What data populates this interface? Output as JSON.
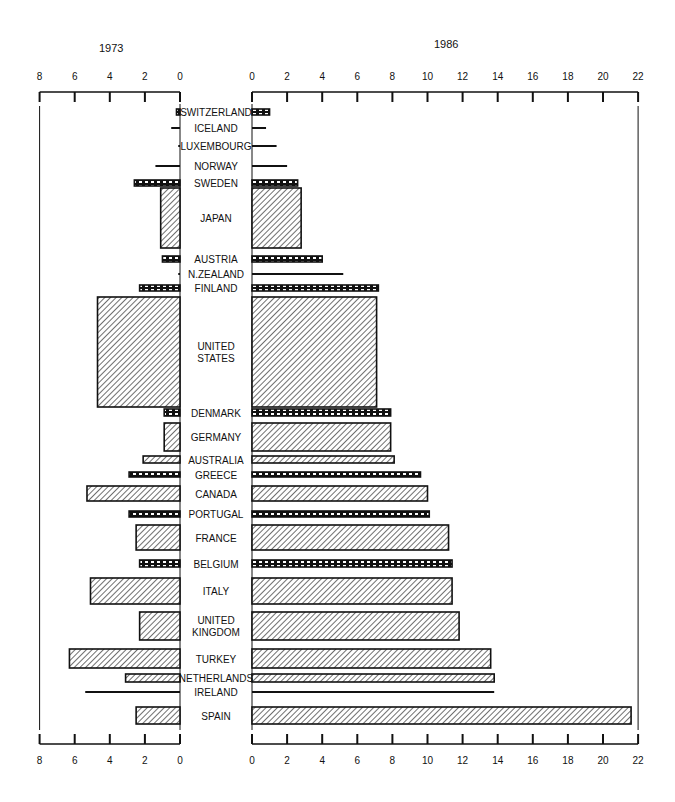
{
  "chart_data": {
    "type": "bar",
    "orientation": "horizontal",
    "layout": "back-to-back (population pyramid style) with central country label column",
    "title": "",
    "series": [
      {
        "name": "1973",
        "side": "left",
        "axis_ticks": [
          8,
          6,
          4,
          2,
          0
        ],
        "values": [
          0.2,
          0.5,
          0.1,
          1.4,
          2.6,
          1.1,
          1.0,
          0.1,
          2.3,
          4.7,
          0.9,
          0.9,
          2.1,
          2.9,
          5.3,
          2.9,
          2.5,
          2.3,
          5.1,
          2.3,
          6.3,
          3.1,
          5.4,
          2.5
        ]
      },
      {
        "name": "1986",
        "side": "right",
        "axis_ticks": [
          0,
          2,
          4,
          6,
          8,
          10,
          12,
          14,
          16,
          18,
          20,
          22
        ],
        "values": [
          1.0,
          0.8,
          1.4,
          2.0,
          2.6,
          2.8,
          4.0,
          5.2,
          7.2,
          7.1,
          7.9,
          7.9,
          8.1,
          9.6,
          10.0,
          10.1,
          11.2,
          11.4,
          11.4,
          11.8,
          13.6,
          13.8,
          13.8,
          21.6
        ]
      }
    ],
    "categories": [
      "SWITZERLAND",
      "ICELAND",
      "LUXEMBOURG",
      "NORWAY",
      "SWEDEN",
      "JAPAN",
      "AUSTRIA",
      "N.ZEALAND",
      "FINLAND",
      "UNITED STATES",
      "DENMARK",
      "GERMANY",
      "AUSTRALIA",
      "GREECE",
      "CANADA",
      "PORTUGAL",
      "FRANCE",
      "BELGIUM",
      "ITALY",
      "UNITED KINGDOM",
      "TURKEY",
      "NETHERLANDS",
      "IRELAND",
      "SPAIN"
    ],
    "bar_heights_note": "bar thickness is proportional to a second variable (country size); thin lines indicate very small values",
    "xlim_left": [
      8,
      0
    ],
    "xlim_right": [
      0,
      22
    ],
    "xlabel": "",
    "ylabel": "",
    "grid": false,
    "legend": "none; year labels above each half"
  },
  "labels": {
    "year_left": "1973",
    "year_right": "1986"
  },
  "rows": [
    {
      "label": [
        "SWITZERLAND"
      ],
      "y": 109,
      "h": 6,
      "style": "dash",
      "l": 0.2,
      "r": 1.0
    },
    {
      "label": [
        "ICELAND"
      ],
      "y": 127,
      "h": 2,
      "style": "line",
      "l": 0.5,
      "r": 0.8
    },
    {
      "label": [
        "LUXEMBOURG"
      ],
      "y": 145,
      "h": 2,
      "style": "line",
      "l": 0.1,
      "r": 1.4
    },
    {
      "label": [
        "NORWAY"
      ],
      "y": 165,
      "h": 2,
      "style": "line",
      "l": 1.4,
      "r": 2.0
    },
    {
      "label": [
        "SWEDEN"
      ],
      "y": 180,
      "h": 6,
      "style": "dash",
      "l": 2.6,
      "r": 2.6
    },
    {
      "label": [
        "JAPAN"
      ],
      "y": 188,
      "h": 60,
      "style": "hatch",
      "l": 1.1,
      "r": 2.8
    },
    {
      "label": [
        "AUSTRIA"
      ],
      "y": 256,
      "h": 6,
      "style": "dash",
      "l": 1.0,
      "r": 4.0
    },
    {
      "label": [
        "N.ZEALAND"
      ],
      "y": 273,
      "h": 2,
      "style": "line",
      "l": 0.1,
      "r": 5.2
    },
    {
      "label": [
        "FINLAND"
      ],
      "y": 285,
      "h": 6,
      "style": "dash",
      "l": 2.3,
      "r": 7.2
    },
    {
      "label": [
        "UNITED",
        "STATES"
      ],
      "y": 297,
      "h": 110,
      "style": "hatch",
      "l": 4.7,
      "r": 7.1
    },
    {
      "label": [
        "DENMARK"
      ],
      "y": 409,
      "h": 7,
      "style": "dash",
      "l": 0.9,
      "r": 7.9
    },
    {
      "label": [
        "GERMANY"
      ],
      "y": 423,
      "h": 28,
      "style": "hatch",
      "l": 0.9,
      "r": 7.9
    },
    {
      "label": [
        "AUSTRALIA"
      ],
      "y": 456,
      "h": 7,
      "style": "hatch",
      "l": 2.1,
      "r": 8.1
    },
    {
      "label": [
        "GREECE"
      ],
      "y": 472,
      "h": 5,
      "style": "dash",
      "l": 2.9,
      "r": 9.6
    },
    {
      "label": [
        "CANADA"
      ],
      "y": 486,
      "h": 15,
      "style": "hatch",
      "l": 5.3,
      "r": 10.0
    },
    {
      "label": [
        "PORTUGAL"
      ],
      "y": 511,
      "h": 6,
      "style": "dash",
      "l": 2.9,
      "r": 10.1
    },
    {
      "label": [
        "FRANCE"
      ],
      "y": 525,
      "h": 25,
      "style": "hatch",
      "l": 2.5,
      "r": 11.2
    },
    {
      "label": [
        "BELGIUM"
      ],
      "y": 560,
      "h": 7,
      "style": "dash",
      "l": 2.3,
      "r": 11.4
    },
    {
      "label": [
        "ITALY"
      ],
      "y": 578,
      "h": 26,
      "style": "hatch",
      "l": 5.1,
      "r": 11.4
    },
    {
      "label": [
        "UNITED",
        "KINGDOM"
      ],
      "y": 612,
      "h": 28,
      "style": "hatch",
      "l": 2.3,
      "r": 11.8
    },
    {
      "label": [
        "TURKEY"
      ],
      "y": 649,
      "h": 19,
      "style": "hatch",
      "l": 6.3,
      "r": 13.6
    },
    {
      "label": [
        "NETHERLANDS"
      ],
      "y": 674,
      "h": 8,
      "style": "hatch",
      "l": 3.1,
      "r": 13.8
    },
    {
      "label": [
        "IRELAND"
      ],
      "y": 691,
      "h": 2,
      "style": "line",
      "l": 5.4,
      "r": 13.8
    },
    {
      "label": [
        "SPAIN"
      ],
      "y": 707,
      "h": 17,
      "style": "hatch",
      "l": 2.5,
      "r": 21.6
    }
  ],
  "colors": {
    "ink": "#111111",
    "background": "#ffffff"
  }
}
